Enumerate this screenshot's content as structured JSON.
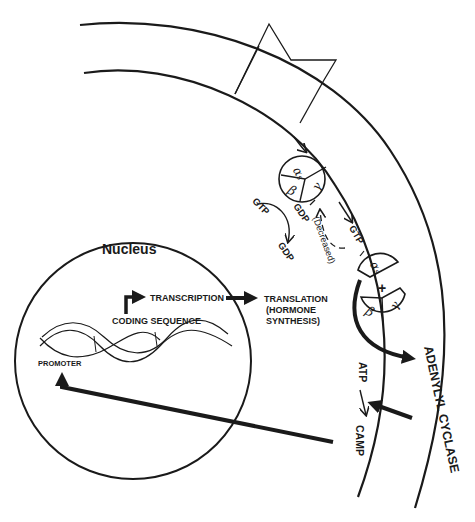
{
  "diagram": {
    "nucleus": {
      "title": "Nucleus",
      "transcription": "TRANSCRIPTION",
      "coding_sequence": "CODING SEQUENCE",
      "promoter": "PROMOTER"
    },
    "translation": {
      "line1": "TRANSLATION",
      "line2": "(HORMONE",
      "line3": "SYNTHESIS)"
    },
    "g_protein": {
      "alpha": "α",
      "alpha_sub": "s",
      "beta": "β",
      "gamma": "γ",
      "plus": "+"
    },
    "cycle": {
      "gtp_left": "GTP",
      "gdp_bottom": "GDP",
      "gdp_top": "GDP",
      "gtp_right": "GTP",
      "decreased": "(Decreased)"
    },
    "membrane": {
      "adenylyl_cyclase": "ADENYLYL CYCLASE",
      "atp": "ATP",
      "camp": "CAMP"
    },
    "colors": {
      "ink": "#1a1a1a",
      "background": "#ffffff"
    }
  }
}
